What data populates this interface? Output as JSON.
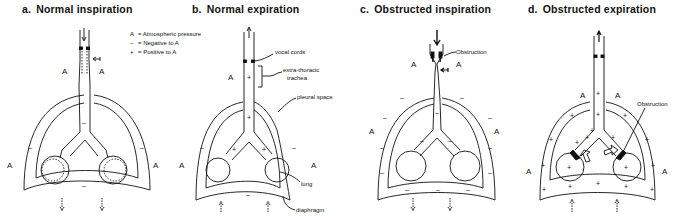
{
  "panels": [
    {
      "id": "a",
      "letter": "a.",
      "title": "Normal inspiration"
    },
    {
      "id": "b",
      "letter": "b.",
      "title": "Normal expiration"
    },
    {
      "id": "c",
      "letter": "c.",
      "title": "Obstructed inspiration"
    },
    {
      "id": "d",
      "letter": "d.",
      "title": "Obstructed expiration"
    }
  ],
  "legend": [
    {
      "symbol": "A",
      "desc": "= Atmospheric pressure"
    },
    {
      "symbol": "–",
      "desc": "= Negative to A"
    },
    {
      "symbol": "+",
      "desc": "= Positive to A"
    }
  ],
  "labels": {
    "atm": "A",
    "neg": "–",
    "pos": "+",
    "vocal_cords": "vocal cords",
    "extra_thoracic_1": "extra-thoracic",
    "extra_thoracic_2": "trachea",
    "pleural_space": "pleural space",
    "lung": "lung",
    "diaphragm": "diaphragm",
    "obstruction_c": "Obstruction",
    "obstruction_d": "Obstruction"
  }
}
